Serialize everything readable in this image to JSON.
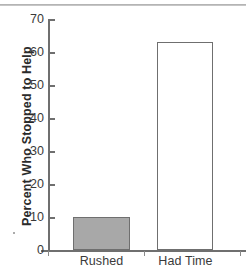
{
  "chart_data": {
    "type": "bar",
    "title": "",
    "xlabel": "",
    "ylabel": "Percent Who Stopped to Help",
    "categories": [
      "Rushed",
      "Had Time"
    ],
    "values": [
      10,
      63
    ],
    "ylim": [
      0,
      70
    ],
    "yticks": [
      "0",
      "10",
      "20",
      "30",
      "40",
      "50",
      "60",
      "70"
    ],
    "grid": false,
    "legend": null,
    "series": [
      {
        "name": "Percent Who Stopped to Help",
        "values": [
          10,
          63
        ],
        "bar_colors": [
          "#a8a8a8",
          "#ffffff"
        ],
        "bar_outline": "#6f6f6f"
      }
    ],
    "colors": {
      "rushed_fill": "#a8a8a8",
      "had_time_fill": "#ffffff",
      "outline": "#6f6f6f",
      "text": "#3a3a3a",
      "title_text": "#2b2b2b",
      "top_rule": "#b4b4b4"
    }
  }
}
